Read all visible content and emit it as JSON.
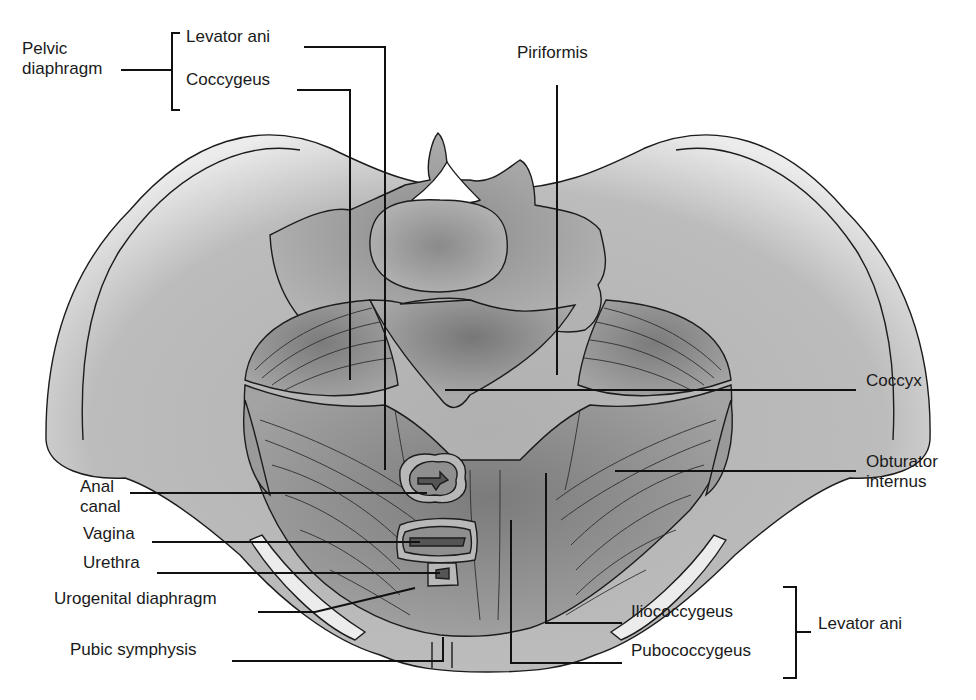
{
  "figure": {
    "colors": {
      "background": "#ffffff",
      "bone": "#b4b4b4",
      "bone_light": "#e6e6e6",
      "muscle": "#8e8e8e",
      "muscle_dark": "#5f5f5f",
      "line": "#111111"
    }
  },
  "labels": {
    "pelvic_diaphragm": {
      "text": "Pelvic\ndiaphragm",
      "x": 22,
      "y": 49
    },
    "levator_ani_top": {
      "text": "Levator ani",
      "x": 186,
      "y": 37
    },
    "coccygeus": {
      "text": "Coccygeus",
      "x": 186,
      "y": 80
    },
    "piriformis": {
      "text": "Piriformis",
      "x": 517,
      "y": 53
    },
    "coccyx": {
      "text": "Coccyx",
      "x": 866,
      "y": 381
    },
    "obturator_internus": {
      "text": "Obturator\ninternus",
      "x": 866,
      "y": 462
    },
    "anal_canal": {
      "text": "Anal\ncanal",
      "x": 80,
      "y": 487
    },
    "vagina": {
      "text": "Vagina",
      "x": 83,
      "y": 534
    },
    "urethra": {
      "text": "Urethra",
      "x": 83,
      "y": 563
    },
    "urogenital_diaphragm": {
      "text": "Urogenital diaphragm",
      "x": 54,
      "y": 599
    },
    "pubic_symphysis": {
      "text": "Pubic symphysis",
      "x": 70,
      "y": 650
    },
    "iliococcygeus": {
      "text": "Iliococcygeus",
      "x": 631,
      "y": 612
    },
    "pubococcygeus": {
      "text": "Pubococcygeus",
      "x": 631,
      "y": 651
    },
    "levator_ani_right": {
      "text": "Levator ani",
      "x": 818,
      "y": 624
    }
  },
  "leader_lines": [
    {
      "name": "pelvic-diaphragm-line",
      "points": "121,70 172,70"
    },
    {
      "name": "pelvic-diaphragm-bracket",
      "points": "180,33 172,33 172,110 180,110"
    },
    {
      "name": "levator-ani-line",
      "points": "304,47 385,47 385,470"
    },
    {
      "name": "coccygeus-line",
      "points": "297,90 350,90 350,380"
    },
    {
      "name": "piriformis-line",
      "points": "557,85 557,375"
    },
    {
      "name": "coccyx-line",
      "points": "445,390 856,390"
    },
    {
      "name": "obturator-internus-line",
      "points": "615,471 856,471"
    },
    {
      "name": "anal-canal-line",
      "points": "130,493 427,493"
    },
    {
      "name": "vagina-line",
      "points": "152,542 420,542"
    },
    {
      "name": "urethra-line",
      "points": "157,573 440,573"
    },
    {
      "name": "urogenital-diaphragm-line",
      "points": "258,612 315,612 415,588"
    },
    {
      "name": "pubic-symphysis-line",
      "points": "232,661 443,661 443,637"
    },
    {
      "name": "iliococcygeus-line",
      "points": "622,623 546,623 546,473"
    },
    {
      "name": "pubococcygeus-line",
      "points": "622,663 511,663 511,520"
    },
    {
      "name": "levator-ani-bracket",
      "points": "783,587 796,587 796,678 783,678"
    },
    {
      "name": "levator-ani-right-line",
      "points": "796,632 811,632"
    }
  ]
}
